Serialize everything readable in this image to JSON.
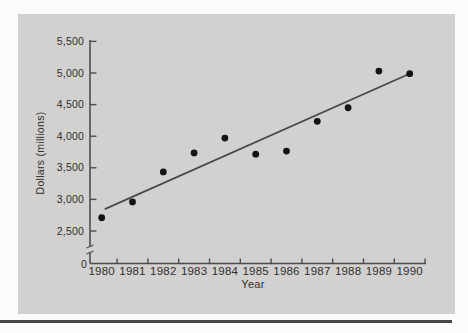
{
  "figure": {
    "panel_background": "#d2d1cf",
    "page_background": "#fbfbfa",
    "bottom_rule_color": "#464646"
  },
  "chart_data": {
    "type": "scatter",
    "title": "",
    "xlabel": "Year",
    "ylabel": "Dollars (millions)",
    "x": [
      1980,
      1981,
      1982,
      1983,
      1984,
      1985,
      1986,
      1987,
      1988,
      1989,
      1990
    ],
    "values": [
      2710,
      2960,
      3435,
      3735,
      3970,
      3715,
      3765,
      4235,
      4450,
      5030,
      4990
    ],
    "trend_line": {
      "x": [
        1980.1,
        1990.05
      ],
      "y": [
        2845,
        5000
      ]
    },
    "y_axis": {
      "ticks": [
        {
          "label": "5,500",
          "value": 5500
        },
        {
          "label": "5,000",
          "value": 5000
        },
        {
          "label": "4,500",
          "value": 4500
        },
        {
          "label": "4,000",
          "value": 4000
        },
        {
          "label": "3,500",
          "value": 3500
        },
        {
          "label": "3,000",
          "value": 3000
        },
        {
          "label": "2,500",
          "value": 2500
        }
      ],
      "zero_label": "0",
      "axis_break": true,
      "display_range": [
        2500,
        5500
      ]
    },
    "x_axis": {
      "ticks_between_categories": true
    },
    "grid": false,
    "legend": null,
    "colors": {
      "point": "#141414",
      "trend": "#4a4a4a",
      "axis": "#4e4e4e",
      "text": "#2e2e2e"
    }
  }
}
